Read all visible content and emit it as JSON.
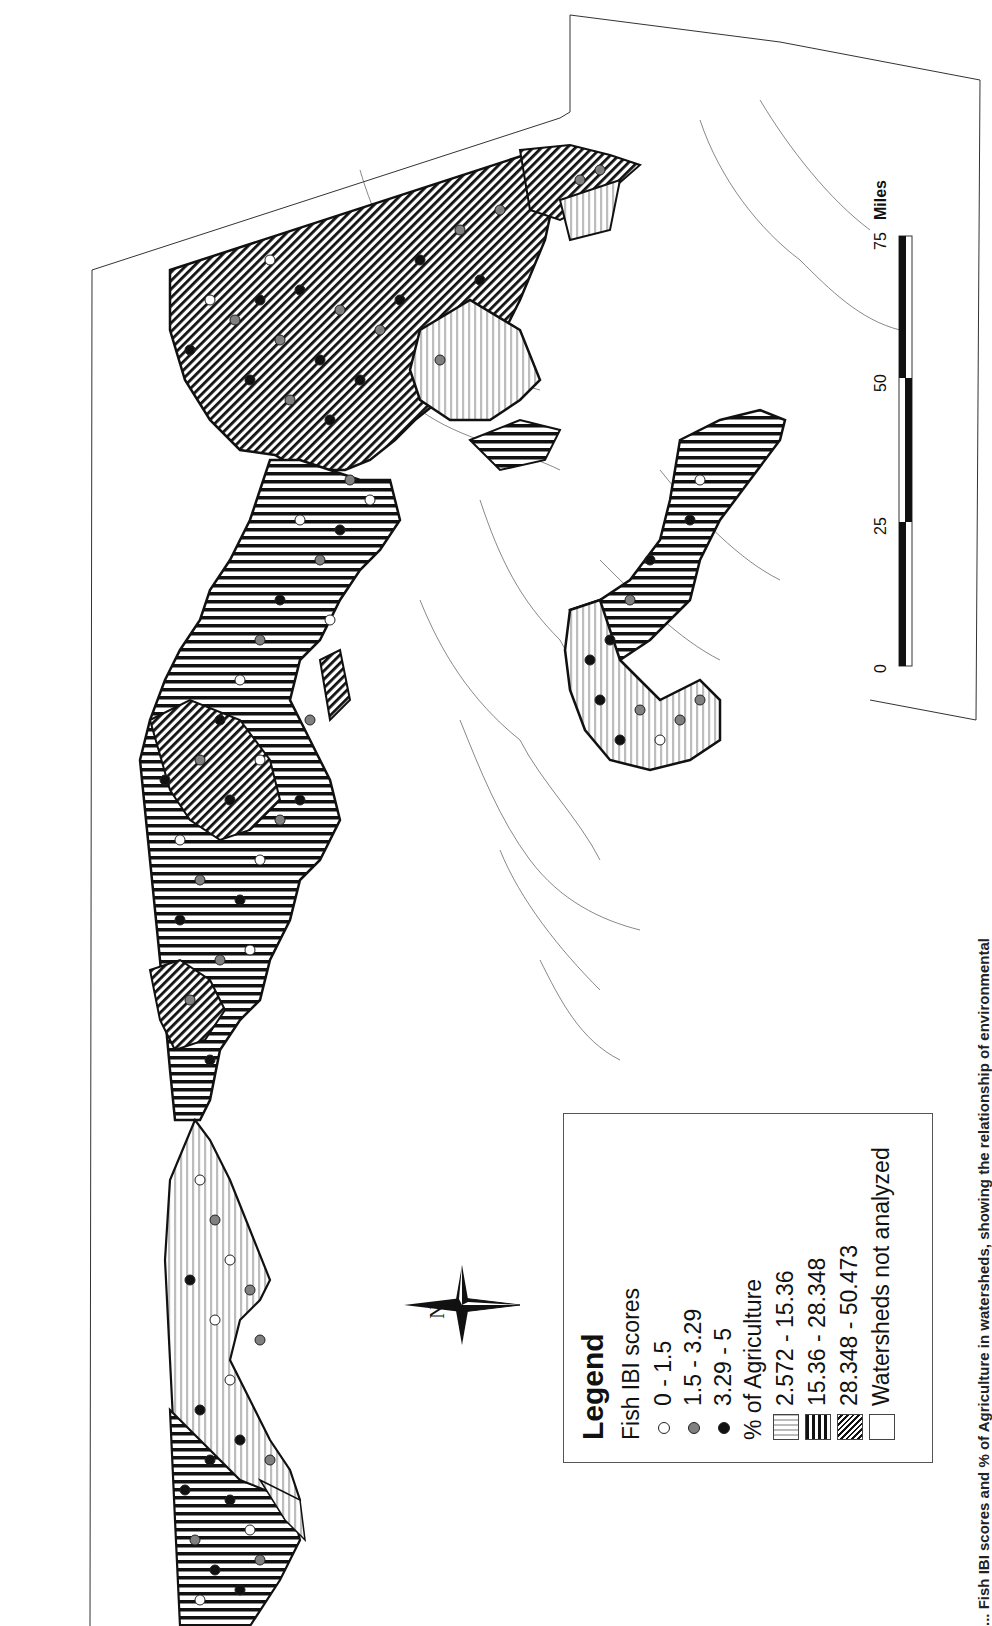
{
  "figure": {
    "orientation": "rotated -90deg (north points left)",
    "caption_visible_fragment": "... Fish IBI scores and % of Agriculture in watersheds, showing the relationship of environmental"
  },
  "legend": {
    "title": "Legend",
    "ibi_heading": "Fish IBI scores",
    "ibi_classes": [
      {
        "label": "0 - 1.5",
        "fill": "#ffffff"
      },
      {
        "label": "1.5 - 3.29",
        "fill": "#808080"
      },
      {
        "label": "3.29 - 5",
        "fill": "#111111"
      }
    ],
    "ag_heading": "% of Agriculture",
    "ag_classes": [
      {
        "label": "2.572 - 15.36",
        "pattern": "light-gray-horizontal-lines"
      },
      {
        "label": "15.36 - 28.348",
        "pattern": "black-vertical-lines"
      },
      {
        "label": "28.348 - 50.473",
        "pattern": "black-diagonal-hatch"
      },
      {
        "label": "Watersheds not analyzed",
        "pattern": "none"
      }
    ]
  },
  "north_arrow": {
    "label": "N"
  },
  "scale_bar": {
    "ticks": [
      "0",
      "25",
      "50",
      "75"
    ],
    "unit": "Miles"
  },
  "colors": {
    "ink": "#111111",
    "mid_gray": "#808080",
    "light_gray": "#bbbbbb",
    "background": "#ffffff"
  }
}
